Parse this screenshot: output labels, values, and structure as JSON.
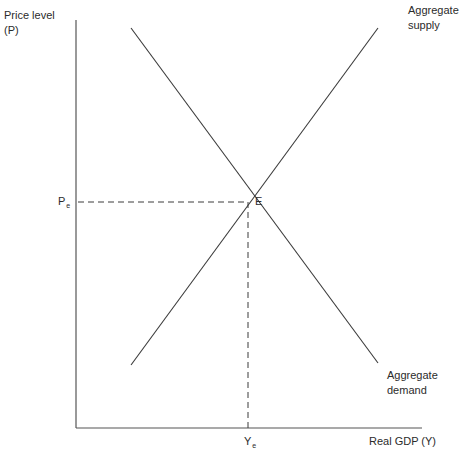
{
  "diagram": {
    "type": "aggregate-demand-aggregate-supply",
    "y_axis": {
      "label_line1": "Price level",
      "label_line2": "(P)"
    },
    "x_axis": {
      "label": "Real GDP (Y)"
    },
    "curves": [
      {
        "name": "Aggregate supply",
        "label_line1": "Aggregate",
        "label_line2": "supply",
        "slope": "upward"
      },
      {
        "name": "Aggregate demand",
        "label_line1": "Aggregate",
        "label_line2": "demand",
        "slope": "downward"
      }
    ],
    "equilibrium": {
      "point_label": "E",
      "price_label": "P",
      "price_subscript": "e",
      "output_label": "Y",
      "output_subscript": "e"
    },
    "colors": {
      "line": "#3a3a3a",
      "axis": "#555555",
      "dashed": "#3a3a3a",
      "text": "#2b2b2b",
      "background": "#ffffff"
    }
  }
}
